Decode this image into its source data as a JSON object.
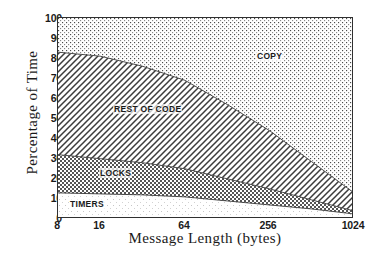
{
  "chart_data": {
    "type": "area",
    "stacked": true,
    "title": "",
    "xlabel": "Message Length (bytes)",
    "ylabel": "Percentage of Time",
    "x_scale": "log2",
    "xlim": [
      8,
      1024
    ],
    "ylim": [
      0,
      100
    ],
    "grid": false,
    "legend": "in-plot region labels",
    "x_tick_labels": [
      "8",
      "16",
      "64",
      "256",
      "1024"
    ],
    "x_tick_values": [
      8,
      16,
      64,
      256,
      1024
    ],
    "y_tick_labels": [
      "0",
      "10",
      "20",
      "30",
      "40",
      "50",
      "60",
      "70",
      "80",
      "90",
      "100"
    ],
    "y_tick_values": [
      0,
      10,
      20,
      30,
      40,
      50,
      60,
      70,
      80,
      90,
      100
    ],
    "x": [
      8,
      16,
      32,
      64,
      128,
      256,
      512,
      1024
    ],
    "series": [
      {
        "name": "TIMERS",
        "fill": "sparse-dots",
        "values": [
          13,
          12.5,
          12,
          11,
          9,
          7,
          5,
          2.5
        ]
      },
      {
        "name": "LOCKS",
        "fill": "checkerboard",
        "values": [
          19,
          17.5,
          16,
          14,
          11,
          8,
          4.5,
          1.5
        ]
      },
      {
        "name": "REST OF CODE",
        "fill": "diagonal-hatch",
        "values": [
          51,
          51,
          48,
          44,
          37,
          29,
          19,
          9
        ]
      },
      {
        "name": "COPY",
        "fill": "fine-dots",
        "values": [
          17,
          19,
          24,
          31,
          43,
          56,
          71.5,
          87
        ]
      }
    ],
    "cumulative_boundaries": {
      "timers_top": [
        13,
        12.5,
        12,
        11,
        9,
        7,
        5,
        2.5
      ],
      "locks_top": [
        32,
        30,
        28,
        25,
        20,
        15,
        9.5,
        4
      ],
      "rest_top": [
        83,
        81,
        76,
        69,
        57,
        44,
        28.5,
        13
      ],
      "copy_top": [
        100,
        100,
        100,
        100,
        100,
        100,
        100,
        100
      ]
    },
    "region_labels": [
      {
        "text": "COPY",
        "x": 256,
        "y": 80
      },
      {
        "text": "REST OF CODE",
        "x": 20,
        "y": 53
      },
      {
        "text": "LOCKS",
        "x": 14,
        "y": 22
      },
      {
        "text": "TIMERS",
        "x": 10,
        "y": 7
      }
    ],
    "colors": {
      "frame": "#303030",
      "ink": "#1a1a1a",
      "background": "#ffffff"
    }
  }
}
